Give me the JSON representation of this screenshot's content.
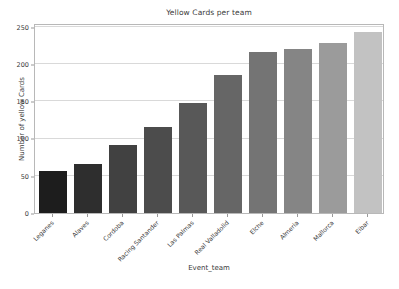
{
  "chart_data": {
    "type": "bar",
    "title": "Yellow Cards per team",
    "xlabel": "Event_team",
    "ylabel": "Number of yellow Cards",
    "categories": [
      "Leganes",
      "Alaves",
      "Cordoba",
      "Racing Santander",
      "Las Palmas",
      "Real Valladolid",
      "Elche",
      "Almeria",
      "Mallorca",
      "Eibar"
    ],
    "values": [
      57,
      66,
      91,
      115,
      148,
      185,
      216,
      220,
      228,
      243
    ],
    "bar_colors": [
      "#1d1d1d",
      "#2e2e2e",
      "#414141",
      "#4c4c4c",
      "#585858",
      "#666666",
      "#747474",
      "#858585",
      "#9b9b9b",
      "#c2c2c2"
    ],
    "ylim": [
      0,
      255
    ],
    "yticks": [
      0,
      50,
      100,
      150,
      200,
      250
    ],
    "ytick_labels": [
      "0",
      "50",
      "100",
      "150",
      "200",
      "250"
    ],
    "grid": true,
    "grid_axis": "y",
    "legend": "none",
    "xtick_rotation": -45,
    "axes_facecolor": "#ffffff",
    "figure_facecolor": "#ffffff",
    "grid_color": "#d9d9d9",
    "text_color": "#3a3a3a"
  }
}
